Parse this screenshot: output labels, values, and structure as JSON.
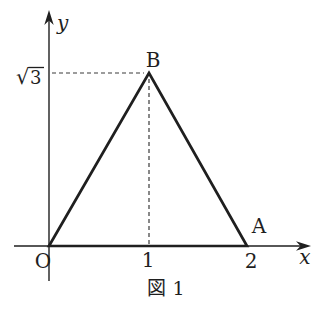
{
  "figure": {
    "caption": "図 1",
    "axis_labels": {
      "x": "x",
      "y": "y"
    },
    "origin_label": "O",
    "tick_labels": {
      "x1": "1",
      "x2": "2"
    },
    "y_tick": {
      "radical": "√",
      "radicand": "3"
    },
    "point_labels": {
      "A": "A",
      "B": "B"
    },
    "colors": {
      "line": "#1f1f1f",
      "dashed": "#3a3a3a",
      "text": "#1f1f1f",
      "background": "#ffffff"
    },
    "points": {
      "O": {
        "x": 0,
        "y": 0
      },
      "A": {
        "x": 2,
        "y": 0
      },
      "B": {
        "x": 1,
        "y": "√3"
      }
    }
  }
}
